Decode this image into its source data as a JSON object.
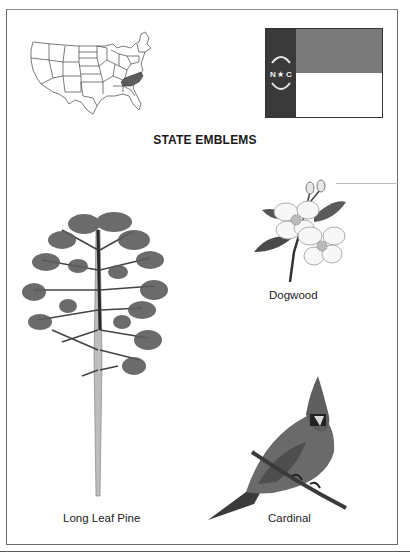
{
  "page": {
    "title": "STATE EMBLEMS"
  },
  "map": {
    "label": "United States map",
    "highlighted_state": "North Carolina",
    "highlight_color": "#5c5c5c"
  },
  "flag": {
    "label": "North Carolina state flag",
    "emblem_text_left": "N",
    "emblem_text_right": "C",
    "emblem_star": "★",
    "union_color": "#3a3a3a",
    "top_bar_color": "#7a7a7a",
    "bottom_bar_color": "#ffffff"
  },
  "emblems": [
    {
      "id": "flower",
      "caption": "Dogwood"
    },
    {
      "id": "tree",
      "caption": "Long Leaf Pine"
    },
    {
      "id": "bird",
      "caption": "Cardinal"
    }
  ]
}
